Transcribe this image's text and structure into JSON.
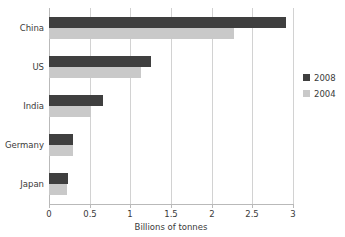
{
  "chart_data": {
    "type": "bar",
    "orientation": "horizontal",
    "title": "",
    "xlabel": "Billions of tonnes",
    "ylabel": "",
    "categories": [
      "China",
      "US",
      "India",
      "Germany",
      "Japan"
    ],
    "series": [
      {
        "name": "2008",
        "color": "#3f3f3f",
        "values": [
          2.91,
          1.26,
          0.67,
          0.29,
          0.23
        ]
      },
      {
        "name": "2004",
        "color": "#c9c9c9",
        "values": [
          2.27,
          1.13,
          0.52,
          0.29,
          0.22
        ]
      }
    ],
    "xlim": [
      0,
      3
    ],
    "xticks": [
      0,
      0.5,
      1,
      1.5,
      2,
      2.5,
      3
    ],
    "xtick_labels": [
      "0",
      "0.5",
      "1",
      "1.5",
      "2",
      "2.5",
      "3"
    ],
    "grid": true,
    "grid_axis": "x",
    "legend_position": "right"
  },
  "legend": {
    "items": [
      {
        "label": "2008",
        "color": "#3f3f3f"
      },
      {
        "label": "2004",
        "color": "#c9c9c9"
      }
    ]
  },
  "colors": {
    "series_2008": "#3f3f3f",
    "series_2004": "#c9c9c9",
    "gridline": "#d2d2d2",
    "axis": "#b9b9b9",
    "text": "#3a3a3a",
    "background": "#ffffff"
  }
}
